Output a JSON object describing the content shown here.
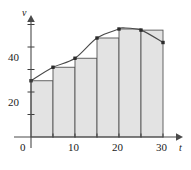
{
  "figure": {
    "background_color": "#ffffff",
    "ink_color": "#3c3c3c",
    "bar_fill_color": "#e3e3e3",
    "bar_edge_color": "#555555",
    "curve_color": "#4a4a4a",
    "marker_color": "#2b2b2b"
  },
  "axes": {
    "x_axis_name": "t",
    "y_axis_name": "v",
    "x_tick_labels": [
      "0",
      "10",
      "20",
      "30"
    ],
    "y_tick_labels": [
      "20",
      "40"
    ],
    "x_tick_values": [
      0,
      10,
      20,
      30
    ],
    "y_tick_values": [
      20,
      40
    ],
    "x_minor_tick_values": [
      5,
      15,
      25
    ],
    "y_minor_tick_values": [
      10,
      30,
      50
    ],
    "x_arrow": true,
    "y_arrow": true
  },
  "chart_data": {
    "type": "bar",
    "title": "",
    "subtitle": "",
    "xlabel": "t",
    "ylabel": "v",
    "xlim": [
      0,
      32
    ],
    "ylim": [
      0,
      54
    ],
    "grid": false,
    "legend": null,
    "bar_width": 5,
    "categories": [
      "0-5",
      "5-10",
      "10-15",
      "15-20",
      "20-25",
      "25-30"
    ],
    "bar_left_edges": [
      0,
      5,
      10,
      15,
      20,
      25
    ],
    "bar_right_edges": [
      5,
      10,
      15,
      20,
      25,
      30
    ],
    "values": [
      25,
      31,
      35,
      44,
      48,
      47.5
    ],
    "series": [
      {
        "name": "velocity bars",
        "type": "bar",
        "values": [
          25,
          31,
          35,
          44,
          48,
          47.5
        ]
      },
      {
        "name": "velocity curve",
        "type": "line",
        "x": [
          0,
          5,
          10,
          15,
          20,
          21,
          25,
          30
        ],
        "y": [
          25,
          31,
          35,
          44,
          48,
          48.5,
          47.5,
          42
        ]
      }
    ],
    "marker_points": [
      {
        "x": 0,
        "y": 25
      },
      {
        "x": 5,
        "y": 31
      },
      {
        "x": 10,
        "y": 35
      },
      {
        "x": 15,
        "y": 44
      },
      {
        "x": 20,
        "y": 48
      },
      {
        "x": 25,
        "y": 47.5
      },
      {
        "x": 30,
        "y": 42
      }
    ]
  }
}
